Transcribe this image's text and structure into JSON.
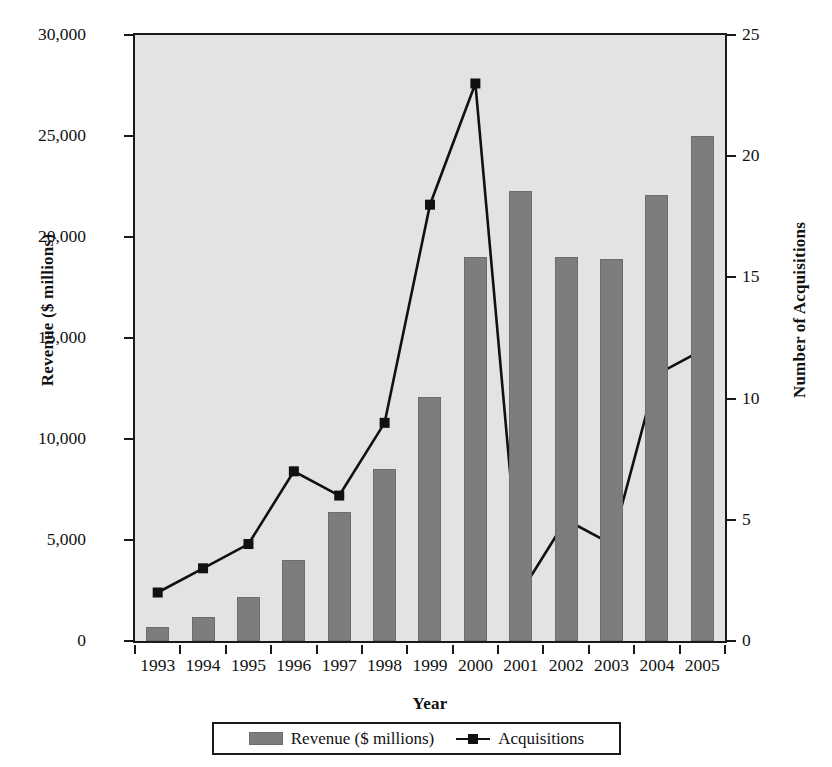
{
  "chart_data": {
    "type": "bar",
    "title": "",
    "xlabel": "Year",
    "ylabel": "Revenue ($ millions)",
    "y2label": "Number of Acquisitions",
    "categories": [
      "1993",
      "1994",
      "1995",
      "1996",
      "1997",
      "1998",
      "1999",
      "2000",
      "2001",
      "2002",
      "2003",
      "2004",
      "2005"
    ],
    "ylim": [
      0,
      30000
    ],
    "y2lim": [
      0,
      25
    ],
    "yticks": [
      "0",
      "5,000",
      "10,000",
      "15,000",
      "20,000",
      "25,000",
      "30,000"
    ],
    "ytick_values": [
      0,
      5000,
      10000,
      15000,
      20000,
      25000,
      30000
    ],
    "y2ticks": [
      "0",
      "5",
      "10",
      "15",
      "20",
      "25"
    ],
    "y2tick_values": [
      0,
      5,
      10,
      15,
      20,
      25
    ],
    "grid": false,
    "legend_position": "bottom",
    "plot_background": "#e3e3e3",
    "series": [
      {
        "name": "Revenue ($ millions)",
        "type": "bar",
        "axis": "left",
        "color": "#7d7d7d",
        "values": [
          700,
          1200,
          2200,
          4000,
          6400,
          8500,
          12100,
          19000,
          22300,
          19000,
          18900,
          22100,
          25000
        ]
      },
      {
        "name": "Acquisitions",
        "type": "line",
        "axis": "right",
        "color": "#111111",
        "marker": "square",
        "values": [
          2,
          3,
          4,
          7,
          6,
          9,
          18,
          23,
          2,
          5,
          4,
          11,
          12
        ]
      }
    ]
  },
  "legend": {
    "items": [
      {
        "label": "Revenue ($ millions)",
        "marker": "bar-swatch"
      },
      {
        "label": "Acquisitions",
        "marker": "line-square-swatch"
      }
    ]
  }
}
